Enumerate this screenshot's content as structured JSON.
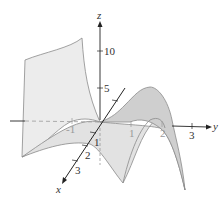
{
  "figure": {
    "colors": {
      "axis": "#222222",
      "surface_fill": "#e6e6e6",
      "surface_dark": "#cfcfcf",
      "surface_edge": "#8a8a8a",
      "hidden_axis": "#999999"
    }
  },
  "axes": {
    "z": {
      "label": "z",
      "ticks": [
        "10",
        "5"
      ]
    },
    "y": {
      "label": "y",
      "ticks": [
        "-1",
        "1",
        "2",
        "3"
      ]
    },
    "x": {
      "label": "x",
      "ticks": [
        "1",
        "2",
        "3"
      ]
    }
  }
}
